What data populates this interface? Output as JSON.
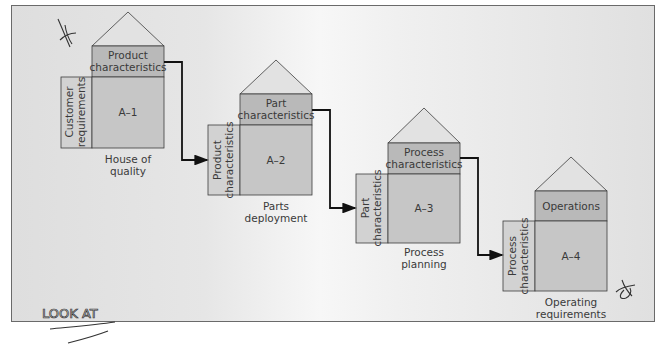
{
  "diagram": {
    "title": "",
    "colors": {
      "background": "#e4e4e4",
      "roof": "#e2e2e2",
      "top_box": "#b9b9b9",
      "main_box": "#c6c6c6",
      "side_column": "#d2d2d2",
      "outline": "#3c3c3c",
      "arrow": "#111111"
    },
    "houses": [
      {
        "id": "A-1",
        "matrix_label": "A–1",
        "top_label_line1": "Product",
        "top_label_line2": "characteristics",
        "side_label_line1": "Customer",
        "side_label_line2": "requirements",
        "caption_line1": "House of",
        "caption_line2": "quality"
      },
      {
        "id": "A-2",
        "matrix_label": "A–2",
        "top_label_line1": "Part",
        "top_label_line2": "characteristics",
        "side_label_line1": "Product",
        "side_label_line2": "characteristics",
        "caption_line1": "Parts",
        "caption_line2": "deployment"
      },
      {
        "id": "A-3",
        "matrix_label": "A–3",
        "top_label_line1": "Process",
        "top_label_line2": "characteristics",
        "side_label_line1": "Part",
        "side_label_line2": "characteristics",
        "caption_line1": "Process",
        "caption_line2": "planning"
      },
      {
        "id": "A-4",
        "matrix_label": "A–4",
        "top_label_line1": "Operations",
        "top_label_line2": "",
        "side_label_line1": "Process",
        "side_label_line2": "characteristics",
        "caption_line1": "Operating",
        "caption_line2": "requirements"
      }
    ],
    "flows": [
      {
        "from": "A-1 Product characteristics",
        "to": "A-2 Product characteristics"
      },
      {
        "from": "A-2 Part characteristics",
        "to": "A-3 Part characteristics"
      },
      {
        "from": "A-3 Process characteristics",
        "to": "A-4 Process characteristics"
      }
    ],
    "annotations": {
      "handwritten_note": "LOOK AT"
    }
  }
}
